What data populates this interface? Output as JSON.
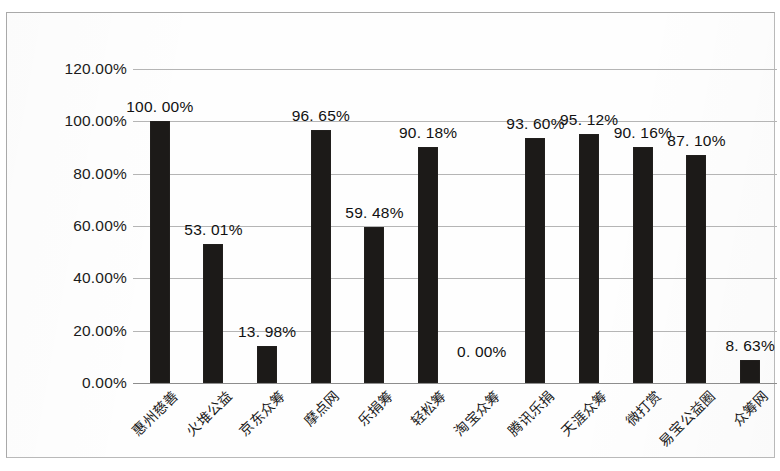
{
  "chart_data": {
    "type": "bar",
    "title": "",
    "subtitle": "",
    "xlabel": "",
    "ylabel": "",
    "ylim": [
      0,
      120
    ],
    "ytick_labels": [
      "0.00%",
      "20.00%",
      "40.00%",
      "60.00%",
      "80.00%",
      "100.00%",
      "120.00%"
    ],
    "ytick_values": [
      0,
      20,
      40,
      60,
      80,
      100,
      120
    ],
    "grid": true,
    "legend": "none",
    "categories": [
      "惠州慈善",
      "火堆公益",
      "京东众筹",
      "摩点网",
      "乐捐筹",
      "轻松筹",
      "淘宝众筹",
      "腾讯乐捐",
      "天涯众筹",
      "微打赏",
      "易宝公益圈",
      "众筹网"
    ],
    "values": [
      100.0,
      53.01,
      13.98,
      96.65,
      59.48,
      90.18,
      0.0,
      93.6,
      95.12,
      90.16,
      87.1,
      8.63
    ],
    "data_labels": [
      "100. 00%",
      "53. 01%",
      "13. 98%",
      "96. 65%",
      "59. 48%",
      "90. 18%",
      "0. 00%",
      "93. 60%",
      "95. 12%",
      "90. 16%",
      "87. 10%",
      "8. 63%"
    ],
    "bar_color": "#1c1a18",
    "gridline_color": "#b5b5b5",
    "background_color": "#fefefe"
  }
}
